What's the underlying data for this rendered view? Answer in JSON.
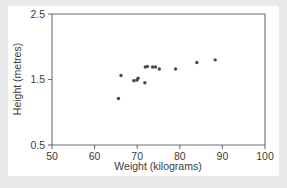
{
  "chart_data": {
    "type": "scatter",
    "title": "",
    "xlabel": "Weight (kilograms)",
    "ylabel": "Height (metres)",
    "xlim": [
      50,
      100
    ],
    "ylim": [
      0.5,
      2.5
    ],
    "xticks": [
      50,
      60,
      70,
      80,
      90,
      100
    ],
    "yticks": [
      0.5,
      1.5,
      2.5
    ],
    "xtick_labels": [
      "50",
      "60",
      "70",
      "80",
      "90",
      "100"
    ],
    "ytick_labels": [
      "0.5",
      "1.5",
      "2.5"
    ],
    "grid": false,
    "legend": false,
    "marker_color": "#4a4a50",
    "points": [
      {
        "x": 65.6,
        "y": 1.21
      },
      {
        "x": 66.2,
        "y": 1.56
      },
      {
        "x": 69.2,
        "y": 1.48
      },
      {
        "x": 69.9,
        "y": 1.49
      },
      {
        "x": 70.2,
        "y": 1.52
      },
      {
        "x": 71.8,
        "y": 1.45
      },
      {
        "x": 71.9,
        "y": 1.69
      },
      {
        "x": 73.6,
        "y": 1.69
      },
      {
        "x": 74.3,
        "y": 1.69
      },
      {
        "x": 75.2,
        "y": 1.66
      },
      {
        "x": 79.0,
        "y": 1.66
      },
      {
        "x": 84.0,
        "y": 1.76
      },
      {
        "x": 88.3,
        "y": 1.8
      },
      {
        "x": 72.4,
        "y": 1.7
      }
    ]
  },
  "figure": {
    "background_color": "#e9e9e9",
    "panel_color": "#ffffff",
    "axis_color": "#6e6e72"
  }
}
